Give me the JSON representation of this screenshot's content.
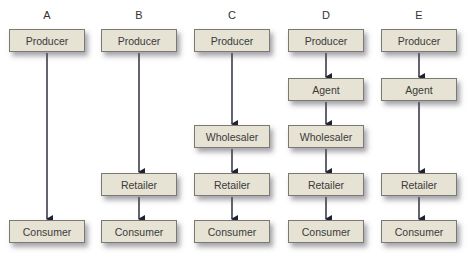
{
  "diagram": {
    "colors": {
      "box_fill": "#e6e2d4",
      "box_border": "#7a7a72",
      "arrow": "#1f2233"
    },
    "channels": [
      {
        "label": "A",
        "nodes": [
          "Producer",
          "Consumer"
        ]
      },
      {
        "label": "B",
        "nodes": [
          "Producer",
          "Retailer",
          "Consumer"
        ]
      },
      {
        "label": "C",
        "nodes": [
          "Producer",
          "Wholesaler",
          "Retailer",
          "Consumer"
        ]
      },
      {
        "label": "D",
        "nodes": [
          "Producer",
          "Agent",
          "Wholesaler",
          "Retailer",
          "Consumer"
        ]
      },
      {
        "label": "E",
        "nodes": [
          "Producer",
          "Agent",
          "Retailer",
          "Consumer"
        ]
      }
    ]
  }
}
